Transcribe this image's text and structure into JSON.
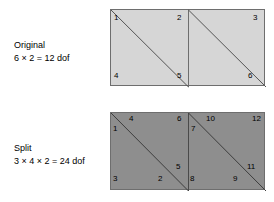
{
  "figure": {
    "name": "mesh-splitting-dof-diagram",
    "background_color": "#ffffff"
  },
  "captions": {
    "original": {
      "title": "Original",
      "formula": "6 × 2 = 12 dof"
    },
    "split": {
      "title": "Split",
      "formula": "3 × 4 × 2 = 24 dof"
    }
  },
  "colors": {
    "original_fill": "#d6d6d6",
    "split_fill": "#8e8e8e",
    "outline": "#6e6e6e",
    "diagonal": "#555555",
    "text": "#000000"
  },
  "diagrams": {
    "original": {
      "name": "original-mesh",
      "fill": "#d6d6d6",
      "cells": 2,
      "node_count": 6,
      "nodes": [
        {
          "label": "1",
          "x": 3,
          "y": 4
        },
        {
          "label": "2",
          "x": 66,
          "y": 4
        },
        {
          "label": "4",
          "x": 3,
          "y": 62
        },
        {
          "label": "5",
          "x": 66,
          "y": 62
        },
        {
          "label": "3",
          "x": 142,
          "y": 4
        },
        {
          "label": "6",
          "x": 137,
          "y": 62
        }
      ]
    },
    "split": {
      "name": "split-mesh",
      "fill": "#8e8e8e",
      "cells": 2,
      "node_count": 12,
      "nodes": [
        {
          "label": "1",
          "x": 2,
          "y": 12
        },
        {
          "label": "4",
          "x": 18,
          "y": 2
        },
        {
          "label": "6",
          "x": 66,
          "y": 2
        },
        {
          "label": "5",
          "x": 65,
          "y": 50
        },
        {
          "label": "3",
          "x": 2,
          "y": 62
        },
        {
          "label": "2",
          "x": 47,
          "y": 62
        },
        {
          "label": "7",
          "x": 80,
          "y": 12
        },
        {
          "label": "10",
          "x": 95,
          "y": 2
        },
        {
          "label": "12",
          "x": 141,
          "y": 2
        },
        {
          "label": "11",
          "x": 136,
          "y": 50
        },
        {
          "label": "8",
          "x": 79,
          "y": 62
        },
        {
          "label": "9",
          "x": 122,
          "y": 62
        }
      ]
    }
  }
}
